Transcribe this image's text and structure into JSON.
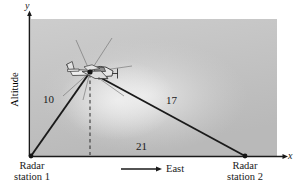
{
  "figure": {
    "type": "geometry-diagram"
  },
  "axes": {
    "y_label": "y",
    "x_label": "x",
    "vertical_axis_title": "Altitude"
  },
  "labels": {
    "left_leg": "10",
    "right_leg": "17",
    "base": "21",
    "direction": "East",
    "station_1_line1": "Radar",
    "station_1_line2": "station 1",
    "station_2_line1": "Radar",
    "station_2_line2": "station 2"
  },
  "colors": {
    "background": "#ffffff",
    "panel_light": "#dcdcdc",
    "panel_mid": "#c6c6c6",
    "panel_dark": "#b4b4b4",
    "line": "#1a1a1a",
    "text": "#1a1a1a",
    "plane_body": "#e8e8e8",
    "plane_outline": "#3a3a3a"
  },
  "geometry": {
    "station_1": [
      31,
      156
    ],
    "station_2": [
      245,
      156
    ],
    "plane": [
      90,
      72
    ],
    "panel": [
      31,
      19,
      246,
      137
    ]
  }
}
